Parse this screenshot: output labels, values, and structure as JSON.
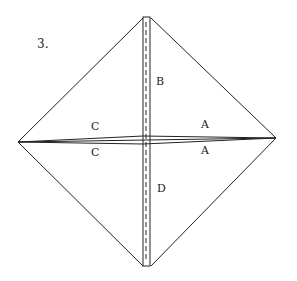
{
  "step_number": "3.",
  "labels": {
    "top": "B",
    "bottom": "D",
    "left_upper": "C",
    "left_lower": "C",
    "right_upper": "A",
    "right_lower": "A"
  },
  "colors": {
    "stroke": "#222222",
    "background": "#ffffff"
  }
}
